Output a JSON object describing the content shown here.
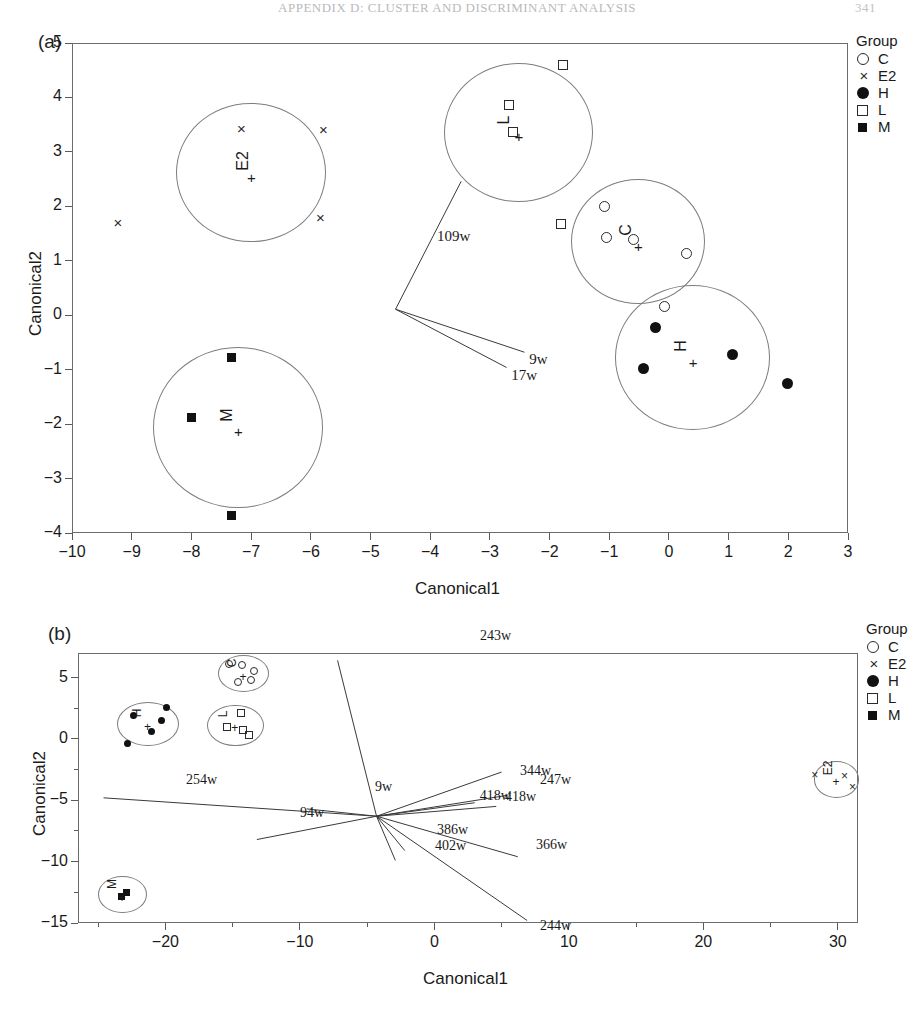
{
  "running_head": {
    "text": "APPENDIX D: CLUSTER AND DISCRIMINANT ANALYSIS",
    "page": "341"
  },
  "legend": {
    "title": "Group",
    "items": [
      {
        "glyph": "open-circle",
        "label": "C"
      },
      {
        "glyph": "cross-x",
        "label": "E2"
      },
      {
        "glyph": "filled-circle",
        "label": "H"
      },
      {
        "glyph": "open-square",
        "label": "L"
      },
      {
        "glyph": "filled-square",
        "label": "M"
      }
    ]
  },
  "panel_a": {
    "tag": "(a)",
    "xlabel": "Canonical1",
    "ylabel": "Canonical2",
    "xticks": [
      "-10",
      "-9",
      "-8",
      "-7",
      "-6",
      "-5",
      "-4",
      "-3",
      "-2",
      "-1",
      "0",
      "1",
      "2",
      "3"
    ],
    "yticks": [
      "5",
      "4",
      "3",
      "2",
      "1",
      "0",
      "-1",
      "-2",
      "-3",
      "-4"
    ],
    "cluster_labels": [
      "E2",
      "L",
      "C",
      "H",
      "M"
    ],
    "centroid_marker": "+",
    "vector_labels": [
      "109w",
      "9w",
      "17w"
    ]
  },
  "panel_b": {
    "tag": "(b)",
    "xlabel": "Canonical1",
    "ylabel": "Canonical2",
    "xticks": [
      "-20",
      "-10",
      "0",
      "10",
      "20",
      "30"
    ],
    "yticks": [
      "5",
      "0",
      "-5",
      "-10",
      "-15"
    ],
    "cluster_labels": [
      "H",
      "C",
      "L",
      "M",
      "E2"
    ],
    "centroid_marker": "+",
    "vector_labels": [
      "243w",
      "344w",
      "247w",
      "418w",
      "418w",
      "9w",
      "254w",
      "94w",
      "386w",
      "402w",
      "366w",
      "244w"
    ]
  },
  "chart_data": [
    {
      "type": "scatter",
      "title": "(a)",
      "xlabel": "Canonical1",
      "ylabel": "Canonical2",
      "xlim": [
        -10,
        3
      ],
      "ylim": [
        -4,
        5
      ],
      "grid": false,
      "legend_position": "right",
      "legend_title": "Group",
      "series": [
        {
          "name": "E2",
          "marker": "x",
          "centroid": [
            -7.0,
            2.62
          ],
          "radius_x": 1.25,
          "radius_y": 1.28,
          "points": [
            [
              -7.15,
              3.42
            ],
            [
              -5.78,
              3.4
            ],
            [
              -5.83,
              1.79
            ],
            [
              -9.22,
              1.69
            ]
          ]
        },
        {
          "name": "L",
          "marker": "open-square",
          "centroid": [
            -2.52,
            3.36
          ],
          "radius_x": 1.25,
          "radius_y": 1.28,
          "points": [
            [
              -1.78,
              4.6
            ],
            [
              -2.68,
              3.86
            ],
            [
              -2.62,
              3.36
            ],
            [
              -1.8,
              1.67
            ]
          ]
        },
        {
          "name": "C",
          "marker": "open-circle",
          "centroid": [
            -0.52,
            1.35
          ],
          "radius_x": 1.12,
          "radius_y": 1.15,
          "points": [
            [
              -1.08,
              2.0
            ],
            [
              -1.05,
              1.42
            ],
            [
              -0.6,
              1.4
            ],
            [
              0.3,
              1.14
            ],
            [
              -0.07,
              0.16
            ]
          ]
        },
        {
          "name": "H",
          "marker": "filled-circle",
          "centroid": [
            0.4,
            -0.78
          ],
          "radius_x": 1.3,
          "radius_y": 1.33,
          "points": [
            [
              -0.22,
              -0.23
            ],
            [
              1.06,
              -0.72
            ],
            [
              -0.43,
              -0.98
            ],
            [
              1.98,
              -1.25
            ]
          ]
        },
        {
          "name": "M",
          "marker": "filled-square",
          "centroid": [
            -7.22,
            -2.06
          ],
          "radius_x": 1.42,
          "radius_y": 1.48,
          "points": [
            [
              -7.32,
              -0.78
            ],
            [
              -8.0,
              -1.88
            ],
            [
              -7.33,
              -3.67
            ]
          ]
        }
      ],
      "vectors": {
        "origin": [
          -4.58,
          0.11
        ],
        "rays": [
          {
            "label": "109w",
            "tip": [
              -3.48,
              2.46
            ]
          },
          {
            "label": "9w",
            "tip": [
              -2.42,
              -0.68
            ]
          },
          {
            "label": "17w",
            "tip": [
              -2.72,
              -0.96
            ]
          }
        ]
      }
    },
    {
      "type": "scatter",
      "title": "(b)",
      "xlabel": "Canonical1",
      "ylabel": "Canonical2",
      "xlim": [
        -26.5,
        31.5
      ],
      "ylim": [
        -15,
        7
      ],
      "grid": false,
      "legend_position": "right",
      "legend_title": "Group",
      "series": [
        {
          "name": "C",
          "marker": "open-circle",
          "centroid": [
            -14.2,
            5.3
          ],
          "radius_x": 1.9,
          "radius_y": 1.5,
          "points": [
            [
              -15.3,
              6.1
            ],
            [
              -14.3,
              6.0
            ],
            [
              -13.4,
              5.5
            ],
            [
              -13.6,
              4.8
            ],
            [
              -14.6,
              4.6
            ]
          ]
        },
        {
          "name": "H",
          "marker": "filled-circle",
          "centroid": [
            -21.3,
            1.2
          ],
          "radius_x": 2.3,
          "radius_y": 1.8,
          "points": [
            [
              -22.4,
              1.9
            ],
            [
              -20.3,
              1.5
            ],
            [
              -19.9,
              2.6
            ],
            [
              -22.8,
              -0.4
            ],
            [
              -21.0,
              0.6
            ]
          ]
        },
        {
          "name": "L",
          "marker": "open-square",
          "centroid": [
            -14.8,
            1.1
          ],
          "radius_x": 2.1,
          "radius_y": 1.7,
          "points": [
            [
              -14.4,
              2.1
            ],
            [
              -15.4,
              1.0
            ],
            [
              -14.2,
              0.7
            ],
            [
              -13.8,
              0.3
            ]
          ]
        },
        {
          "name": "M",
          "marker": "filled-square",
          "centroid": [
            -23.2,
            -12.7
          ],
          "radius_x": 1.8,
          "radius_y": 1.5,
          "points": [
            [
              -23.3,
              -12.8
            ],
            [
              -22.9,
              -12.5
            ]
          ]
        },
        {
          "name": "E2",
          "marker": "x",
          "centroid": [
            29.9,
            -3.3
          ],
          "radius_x": 1.7,
          "radius_y": 1.5,
          "points": [
            [
              28.4,
              -2.9
            ],
            [
              30.6,
              -3.0
            ],
            [
              31.2,
              -3.9
            ]
          ]
        }
      ],
      "vectors": {
        "origin": [
          -4.3,
          -6.3
        ],
        "rays": [
          {
            "label": "243w",
            "tip": [
              -7.2,
              6.4
            ]
          },
          {
            "label": "344w",
            "tip": [
              5.0,
              -2.7
            ]
          },
          {
            "label": "247w",
            "tip": [
              5.4,
              -4.6
            ]
          },
          {
            "label": "418w",
            "tip": [
              3.0,
              -5.2
            ]
          },
          {
            "label": "418w",
            "tip": [
              4.6,
              -5.5
            ]
          },
          {
            "label": "9w",
            "tip": [
              -9.5,
              -5.7
            ]
          },
          {
            "label": "254w",
            "tip": [
              -24.6,
              -4.8
            ]
          },
          {
            "label": "94w",
            "tip": [
              -13.2,
              -8.2
            ]
          },
          {
            "label": "386w",
            "tip": [
              -2.2,
              -9.1
            ]
          },
          {
            "label": "402w",
            "tip": [
              -2.9,
              -9.9
            ]
          },
          {
            "label": "366w",
            "tip": [
              6.2,
              -9.6
            ]
          },
          {
            "label": "244w",
            "tip": [
              6.9,
              -14.8
            ]
          }
        ]
      }
    }
  ]
}
